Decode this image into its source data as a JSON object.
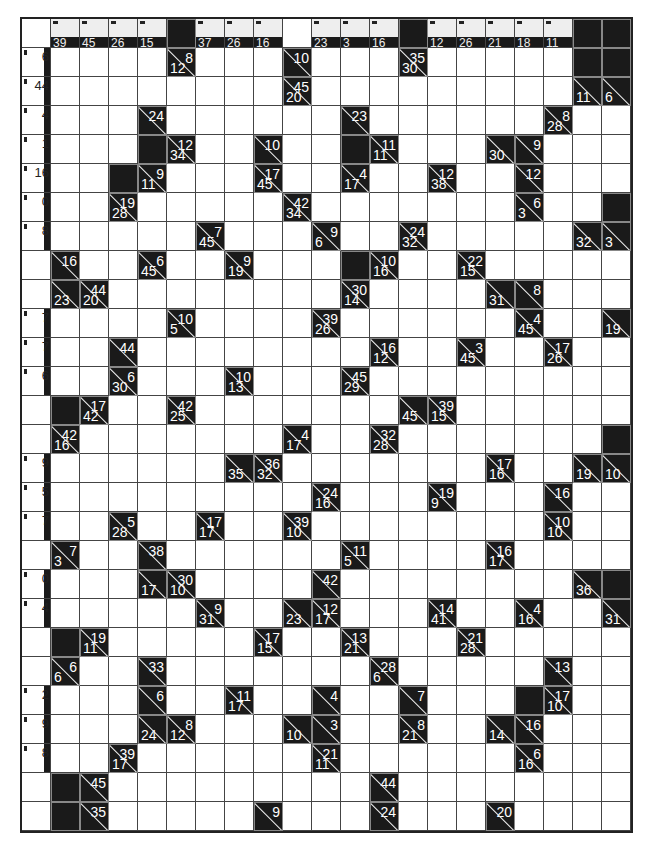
{
  "puzzle": {
    "type": "kakuro",
    "cols": 21,
    "rows": 28,
    "legend": "W = white entry cell, B = solid black cell, {d,r} = clue cell with down sum (bottom-left) and right sum (top-right)",
    "header_row": [
      null,
      "39",
      "45",
      "26",
      "15",
      "B",
      "37",
      "26",
      "16",
      "",
      "23",
      "3",
      "16",
      "B",
      "12",
      "26",
      "21",
      "18",
      "11",
      "B",
      "B"
    ],
    "row_labels": [
      null,
      "6",
      "44",
      "4",
      "1",
      "16",
      "0",
      "8",
      "",
      "",
      "7",
      "7",
      "6",
      "",
      "",
      "9",
      "5",
      "7",
      "",
      "0",
      "4",
      "",
      "",
      "2",
      "9",
      "8",
      "",
      ""
    ],
    "grid": [
      [],
      [
        "W",
        "W",
        "W",
        "W",
        {
          "d": "12",
          "r": "8"
        },
        "W",
        "W",
        "W",
        {
          "r": "10"
        },
        "W",
        "W",
        "W",
        {
          "d": "30",
          "r": "35"
        },
        "W",
        "W",
        "W",
        "W",
        "W",
        "B",
        "B"
      ],
      [
        "W",
        "W",
        "W",
        "W",
        "W",
        "W",
        "W",
        "W",
        {
          "d": "20",
          "r": "45"
        },
        "W",
        "W",
        "W",
        "W",
        "W",
        "W",
        "W",
        "W",
        "W",
        {
          "d": "11"
        },
        {
          "d": "6"
        }
      ],
      [
        "W",
        "W",
        "W",
        {
          "r": "24"
        },
        "W",
        "W",
        "W",
        "W",
        "W",
        "W",
        {
          "r": "23"
        },
        "W",
        "W",
        "W",
        "W",
        "W",
        "W",
        {
          "d": "28",
          "r": "8"
        },
        "W",
        "W"
      ],
      [
        "W",
        "W",
        "W",
        "B",
        {
          "d": "34",
          "r": "12"
        },
        "W",
        "W",
        {
          "r": "10"
        },
        "W",
        "W",
        "B",
        {
          "d": "11",
          "r": "11"
        },
        "W",
        "W",
        "W",
        {
          "d": "30"
        },
        {
          "r": "9"
        },
        "W",
        "W",
        "W"
      ],
      [
        "W",
        "W",
        "B",
        {
          "d": "11",
          "r": "9"
        },
        "W",
        "W",
        "W",
        {
          "d": "45",
          "r": "17"
        },
        "W",
        "W",
        {
          "d": "17",
          "r": "4"
        },
        "W",
        "W",
        {
          "d": "38",
          "r": "12"
        },
        "W",
        "W",
        {
          "r": "12"
        },
        "W",
        "W",
        "W"
      ],
      [
        "W",
        "W",
        {
          "d": "28",
          "r": "19"
        },
        "W",
        "W",
        "W",
        "W",
        "W",
        {
          "d": "34",
          "r": "42"
        },
        "W",
        "W",
        "W",
        "W",
        "W",
        "W",
        "W",
        {
          "d": "3",
          "r": "6"
        },
        "W",
        "W",
        "B"
      ],
      [
        "W",
        "W",
        "W",
        "W",
        "W",
        {
          "d": "45",
          "r": "7"
        },
        "W",
        "W",
        "W",
        {
          "d": "6",
          "r": "9"
        },
        "W",
        "W",
        {
          "d": "32",
          "r": "24"
        },
        "W",
        "W",
        "W",
        "W",
        "W",
        {
          "d": "32"
        },
        {
          "d": "3"
        }
      ],
      [
        {
          "r": "16"
        },
        "W",
        "W",
        {
          "d": "45",
          "r": "6"
        },
        "W",
        "W",
        {
          "d": "19",
          "r": "9"
        },
        "W",
        "W",
        "W",
        "B",
        {
          "d": "16",
          "r": "10"
        },
        "W",
        "W",
        {
          "d": "15",
          "r": "22"
        },
        "W",
        "W",
        "W",
        "W",
        "W"
      ],
      [
        {
          "d": "23"
        },
        {
          "d": "20",
          "r": "44"
        },
        "W",
        "W",
        "W",
        "W",
        "W",
        "W",
        "W",
        "W",
        {
          "d": "14",
          "r": "30"
        },
        "W",
        "W",
        "W",
        "W",
        {
          "d": "31"
        },
        {
          "r": "8"
        },
        "W",
        "W",
        "W"
      ],
      [
        "W",
        "W",
        "W",
        "W",
        {
          "d": "5",
          "r": "10"
        },
        "W",
        "W",
        "W",
        "W",
        {
          "d": "26",
          "r": "39"
        },
        "W",
        "W",
        "W",
        "W",
        "W",
        "W",
        {
          "d": "45",
          "r": "4"
        },
        "W",
        "W",
        {
          "d": "19"
        }
      ],
      [
        "W",
        "W",
        {
          "r": "44"
        },
        "W",
        "W",
        "W",
        "W",
        "W",
        "W",
        "W",
        "W",
        {
          "d": "12",
          "r": "16"
        },
        "W",
        "W",
        {
          "d": "45",
          "r": "3"
        },
        "W",
        "W",
        {
          "d": "26",
          "r": "17"
        },
        "W",
        "W"
      ],
      [
        "W",
        "W",
        {
          "d": "30",
          "r": "6"
        },
        "W",
        "W",
        "W",
        {
          "d": "13",
          "r": "10"
        },
        "W",
        "W",
        "W",
        {
          "d": "29",
          "r": "45"
        },
        "W",
        "W",
        "W",
        "W",
        "W",
        "W",
        "W",
        "W",
        "W"
      ],
      [
        "B",
        {
          "d": "42",
          "r": "17"
        },
        "W",
        "W",
        {
          "d": "25",
          "r": "42"
        },
        "W",
        "W",
        "W",
        "W",
        "W",
        "W",
        "W",
        {
          "d": "45"
        },
        {
          "d": "15",
          "r": "39"
        },
        "W",
        "W",
        "W",
        "W",
        "W",
        "W"
      ],
      [
        {
          "d": "16",
          "r": "42"
        },
        "W",
        "W",
        "W",
        "W",
        "W",
        "W",
        "W",
        {
          "d": "17",
          "r": "4"
        },
        "W",
        "W",
        {
          "d": "28",
          "r": "32"
        },
        "W",
        "W",
        "W",
        "W",
        "W",
        "W",
        "W",
        "B"
      ],
      [
        "W",
        "W",
        "W",
        "W",
        "W",
        "W",
        {
          "d": "35"
        },
        {
          "d": "32",
          "r": "36"
        },
        "W",
        "W",
        "W",
        "W",
        "W",
        "W",
        "W",
        {
          "d": "16",
          "r": "17"
        },
        "W",
        "W",
        {
          "d": "19"
        },
        {
          "d": "10"
        }
      ],
      [
        "W",
        "W",
        "W",
        "W",
        "W",
        "W",
        "W",
        "W",
        "W",
        {
          "d": "16",
          "r": "24"
        },
        "W",
        "W",
        "W",
        {
          "d": "9",
          "r": "19"
        },
        "W",
        "W",
        "W",
        {
          "r": "16"
        },
        "W",
        "W"
      ],
      [
        "W",
        "W",
        {
          "d": "28",
          "r": "5"
        },
        "W",
        "W",
        {
          "d": "17",
          "r": "17"
        },
        "W",
        "W",
        {
          "d": "10",
          "r": "39"
        },
        "W",
        "W",
        "W",
        "W",
        "W",
        "W",
        "W",
        "W",
        {
          "d": "10",
          "r": "10"
        },
        "W",
        "W"
      ],
      [
        {
          "d": "3",
          "r": "7"
        },
        "W",
        "W",
        {
          "r": "38"
        },
        "W",
        "W",
        "W",
        "W",
        "W",
        "W",
        {
          "d": "5",
          "r": "11"
        },
        "W",
        "W",
        "W",
        "W",
        {
          "d": "17",
          "r": "16"
        },
        "W",
        "W",
        "W",
        "W"
      ],
      [
        "W",
        "W",
        "W",
        {
          "d": "17"
        },
        {
          "d": "10",
          "r": "30"
        },
        "W",
        "W",
        "W",
        "W",
        {
          "r": "42"
        },
        "W",
        "W",
        "W",
        "W",
        "W",
        "W",
        "W",
        "W",
        {
          "d": "36"
        },
        "B"
      ],
      [
        "W",
        "W",
        "W",
        "W",
        "W",
        {
          "d": "31",
          "r": "9"
        },
        "W",
        "W",
        {
          "d": "23"
        },
        {
          "d": "17",
          "r": "12"
        },
        "W",
        "W",
        "W",
        {
          "d": "41",
          "r": "14"
        },
        "W",
        "W",
        {
          "d": "16",
          "r": "4"
        },
        "W",
        "W",
        {
          "d": "31"
        }
      ],
      [
        "B",
        {
          "d": "11",
          "r": "19"
        },
        "W",
        "W",
        "W",
        "W",
        "W",
        {
          "d": "15",
          "r": "17"
        },
        "W",
        "W",
        {
          "d": "21",
          "r": "13"
        },
        "W",
        "W",
        "W",
        {
          "d": "28",
          "r": "21"
        },
        "W",
        "W",
        "W",
        "W",
        "W"
      ],
      [
        {
          "d": "6",
          "r": "6"
        },
        "W",
        "W",
        {
          "r": "33"
        },
        "W",
        "W",
        "W",
        "W",
        "W",
        "W",
        "W",
        {
          "d": "6",
          "r": "28"
        },
        "W",
        "W",
        "W",
        "W",
        "W",
        {
          "r": "13"
        },
        "W",
        "W"
      ],
      [
        "W",
        "W",
        "W",
        {
          "r": "6"
        },
        "W",
        "W",
        {
          "d": "17",
          "r": "11"
        },
        "W",
        "W",
        {
          "r": "4"
        },
        "W",
        "W",
        {
          "r": "7"
        },
        "W",
        "W",
        "W",
        "B",
        {
          "d": "10",
          "r": "17"
        },
        "W",
        "W"
      ],
      [
        "W",
        "W",
        "W",
        {
          "d": "24"
        },
        {
          "d": "12",
          "r": "8"
        },
        "W",
        "W",
        "W",
        {
          "d": "10"
        },
        {
          "r": "3"
        },
        "W",
        "W",
        {
          "d": "21",
          "r": "8"
        },
        "W",
        "W",
        {
          "d": "14"
        },
        {
          "r": "16"
        },
        "W",
        "W",
        "W"
      ],
      [
        "W",
        "W",
        {
          "d": "17",
          "r": "39"
        },
        "W",
        "W",
        "W",
        "W",
        "W",
        "W",
        {
          "d": "11",
          "r": "21"
        },
        "W",
        "W",
        "W",
        "W",
        "W",
        "W",
        {
          "d": "16",
          "r": "6"
        },
        "W",
        "W",
        "W"
      ],
      [
        "B",
        {
          "r": "45"
        },
        "W",
        "W",
        "W",
        "W",
        "W",
        "W",
        "W",
        "W",
        "W",
        {
          "r": "44"
        },
        "W",
        "W",
        "W",
        "W",
        "W",
        "W",
        "W",
        "W"
      ],
      [
        "B",
        {
          "r": "35"
        },
        "W",
        "W",
        "W",
        "W",
        "W",
        {
          "r": "9"
        },
        "W",
        "W",
        "W",
        {
          "r": "24"
        },
        "W",
        "W",
        "W",
        {
          "r": "20"
        },
        "W",
        "W",
        "W",
        "W"
      ]
    ]
  }
}
